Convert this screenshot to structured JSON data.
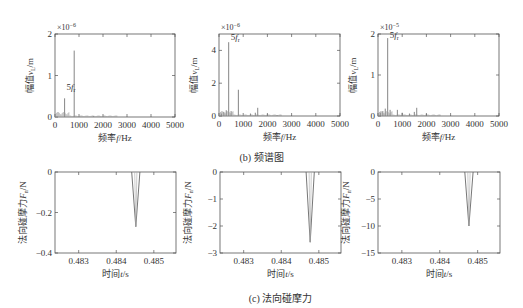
{
  "figure": {
    "caption_b": "(b) 频谱图",
    "caption_c": "(c) 法向碰摩力"
  },
  "colors": {
    "axis": "#555555",
    "line": "#666666",
    "text": "#333333"
  },
  "chart_data": [
    {
      "id": "spectrum-1",
      "type": "line",
      "title": "",
      "xlabel": "频率f/Hz",
      "ylabel": "幅值v_L/m",
      "xlim": [
        0,
        5000
      ],
      "ylim": [
        0,
        2
      ],
      "y_multiplier": "×10^-6",
      "xticks": [
        0,
        1000,
        2000,
        3000,
        4000,
        5000
      ],
      "yticks": [
        0,
        1,
        2
      ],
      "annotation": {
        "text": "5f_r",
        "x": 400,
        "y": 0.6
      },
      "spikes": [
        {
          "x": 400,
          "y": 0.45
        },
        {
          "x": 800,
          "y": 1.6
        },
        {
          "x": 1600,
          "y": 0.02
        }
      ]
    },
    {
      "id": "spectrum-2",
      "type": "line",
      "title": "",
      "xlabel": "频率f/Hz",
      "ylabel": "幅值v_L/m",
      "xlim": [
        0,
        5000
      ],
      "ylim": [
        0,
        5
      ],
      "y_multiplier": "×10^-6",
      "xticks": [
        0,
        1000,
        2000,
        3000,
        4000,
        5000
      ],
      "yticks": [
        0,
        2,
        4
      ],
      "annotation": {
        "text": "5f_r",
        "x": 400,
        "y": 4.5
      },
      "spikes": [
        {
          "x": 100,
          "y": 0.15
        },
        {
          "x": 200,
          "y": 0.25
        },
        {
          "x": 300,
          "y": 0.35
        },
        {
          "x": 400,
          "y": 4.5
        },
        {
          "x": 500,
          "y": 0.3
        },
        {
          "x": 800,
          "y": 1.6
        },
        {
          "x": 1300,
          "y": 0.15
        },
        {
          "x": 1500,
          "y": 0.2
        },
        {
          "x": 1600,
          "y": 0.5
        },
        {
          "x": 2000,
          "y": 0.1
        },
        {
          "x": 2400,
          "y": 0.05
        }
      ]
    },
    {
      "id": "spectrum-3",
      "type": "line",
      "title": "",
      "xlabel": "频率f/Hz",
      "ylabel": "幅值v_L/m",
      "xlim": [
        0,
        5000
      ],
      "ylim": [
        0,
        2
      ],
      "y_multiplier": "×10^-5",
      "xticks": [
        0,
        1000,
        2000,
        3000,
        4000,
        5000
      ],
      "yticks": [
        0,
        1,
        2
      ],
      "annotation": {
        "text": "5f_r",
        "x": 400,
        "y": 1.85
      },
      "spikes": [
        {
          "x": 100,
          "y": 0.08
        },
        {
          "x": 200,
          "y": 0.12
        },
        {
          "x": 300,
          "y": 0.18
        },
        {
          "x": 400,
          "y": 1.9
        },
        {
          "x": 500,
          "y": 0.15
        },
        {
          "x": 800,
          "y": 0.15
        },
        {
          "x": 1000,
          "y": 0.08
        },
        {
          "x": 1300,
          "y": 0.06
        },
        {
          "x": 1500,
          "y": 0.1
        },
        {
          "x": 1600,
          "y": 0.2
        },
        {
          "x": 2000,
          "y": 0.05
        }
      ]
    },
    {
      "id": "force-1",
      "type": "line",
      "title": "",
      "xlabel": "时间t/s",
      "ylabel": "法向碰摩力F_n/N",
      "xlim": [
        0.48237,
        0.48559
      ],
      "ylim": [
        -0.4,
        0
      ],
      "xticks": [
        0.483,
        0.484,
        0.485
      ],
      "yticks": [
        0,
        -0.2,
        -0.4
      ],
      "ytick_labels": [
        "0",
        "−0.2",
        "−0.4"
      ],
      "points": [
        [
          0.48441,
          0
        ],
        [
          0.48452,
          -0.27
        ],
        [
          0.48463,
          0
        ]
      ]
    },
    {
      "id": "force-2",
      "type": "line",
      "title": "",
      "xlabel": "时间t/s",
      "ylabel": "法向碰摩力F_n/N",
      "xlim": [
        0.48237,
        0.48559
      ],
      "ylim": [
        -3,
        0
      ],
      "xticks": [
        0.483,
        0.484,
        0.485
      ],
      "yticks": [
        0,
        -1,
        -2,
        -3
      ],
      "ytick_labels": [
        "0",
        "−1",
        "−2",
        "−3"
      ],
      "points": [
        [
          0.48466,
          0
        ],
        [
          0.48477,
          -2.6
        ],
        [
          0.48488,
          0
        ]
      ]
    },
    {
      "id": "force-3",
      "type": "line",
      "title": "",
      "xlabel": "时间t/s",
      "ylabel": "法向碰摩力F_n/N",
      "xlim": [
        0.48237,
        0.48559
      ],
      "ylim": [
        -15,
        0
      ],
      "xticks": [
        0.483,
        0.484,
        0.485
      ],
      "yticks": [
        0,
        -5,
        -10,
        -15
      ],
      "ytick_labels": [
        "0",
        "−5",
        "−10",
        "−15"
      ],
      "points": [
        [
          0.48466,
          0
        ],
        [
          0.48477,
          -10
        ],
        [
          0.48488,
          0
        ]
      ]
    }
  ],
  "layout": {
    "plots": [
      {
        "x": 55,
        "y": 34,
        "w": 120,
        "h": 83
      },
      {
        "x": 219,
        "y": 34,
        "w": 121,
        "h": 82
      },
      {
        "x": 378,
        "y": 34,
        "w": 121,
        "h": 82
      },
      {
        "x": 55,
        "y": 172,
        "w": 121,
        "h": 81
      },
      {
        "x": 220,
        "y": 172,
        "w": 121,
        "h": 81
      },
      {
        "x": 378,
        "y": 172,
        "w": 122,
        "h": 81
      }
    ]
  }
}
